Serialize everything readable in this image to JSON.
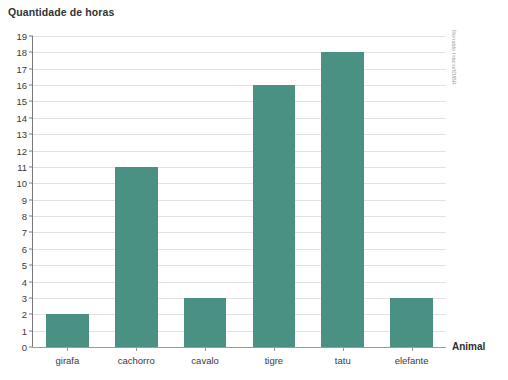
{
  "chart_data": {
    "type": "bar",
    "title": "Quantidade de horas",
    "xlabel": "Animal",
    "ylabel": "",
    "categories": [
      "girafa",
      "cachorro",
      "cavalo",
      "tigre",
      "tatu",
      "elefante"
    ],
    "values": [
      2,
      11,
      3,
      16,
      18,
      3
    ],
    "ylim": [
      0,
      19
    ],
    "ytick_labels": [
      "0",
      "1",
      "2",
      "3",
      "4",
      "5",
      "6",
      "7",
      "8",
      "9",
      "10",
      "11",
      "12",
      "13",
      "14",
      "15",
      "16",
      "17",
      "18",
      "19"
    ],
    "ytick_values": [
      0,
      1,
      2,
      3,
      4,
      5,
      6,
      7,
      8,
      9,
      10,
      11,
      12,
      13,
      14,
      15,
      16,
      17,
      18,
      19
    ],
    "grid": true,
    "legend": false,
    "bar_color": "#4a9183",
    "gridline_color": "#e2e2e2",
    "axis_color": "#7a7a7a"
  },
  "credit": "Ronaldo Inácio/ID/BR"
}
